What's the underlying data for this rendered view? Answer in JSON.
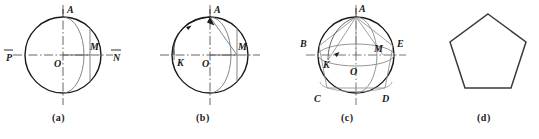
{
  "figure_set": {
    "description": "Four-panel geometric construction of a regular pentagon inscribed in a circle / sphere projection",
    "panels": [
      {
        "id": "a",
        "caption": "(a)",
        "caption_x": 56,
        "caption_y": 122,
        "labels": [
          {
            "name": "point-A",
            "text": "A",
            "x": 67,
            "y": 13,
            "overline": false
          },
          {
            "name": "point-P",
            "text": "P",
            "x": 9,
            "y": 61,
            "overline": true
          },
          {
            "name": "point-N",
            "text": "N",
            "x": 114,
            "y": 61,
            "overline": true
          },
          {
            "name": "point-O",
            "text": "O",
            "x": 57,
            "y": 67,
            "overline": false
          },
          {
            "name": "point-M",
            "text": "M",
            "x": 92,
            "y": 52,
            "overline": false
          }
        ]
      },
      {
        "id": "b",
        "caption": "(b)",
        "caption_x": 198,
        "caption_y": 122,
        "labels": [
          {
            "name": "point-A",
            "text": "A",
            "x": 213,
            "y": 13,
            "overline": false
          },
          {
            "name": "point-K",
            "text": "K",
            "x": 178,
            "y": 66,
            "overline": false
          },
          {
            "name": "point-O",
            "text": "O",
            "x": 203,
            "y": 67,
            "overline": false
          },
          {
            "name": "point-M",
            "text": "M",
            "x": 239,
            "y": 52,
            "overline": false
          }
        ]
      },
      {
        "id": "c",
        "caption": "(c)",
        "caption_x": 345,
        "caption_y": 122,
        "labels": [
          {
            "name": "point-A",
            "text": "A",
            "x": 357,
            "y": 12,
            "overline": false
          },
          {
            "name": "point-B",
            "text": "B",
            "x": 299,
            "y": 45,
            "overline": false
          },
          {
            "name": "point-E",
            "text": "E",
            "x": 393,
            "y": 45,
            "overline": false
          },
          {
            "name": "point-K",
            "text": "K",
            "x": 322,
            "y": 66,
            "overline": false
          },
          {
            "name": "point-O",
            "text": "O",
            "x": 350,
            "y": 73,
            "overline": false
          },
          {
            "name": "point-M",
            "text": "M",
            "x": 377,
            "y": 52,
            "overline": false
          },
          {
            "name": "point-C",
            "text": "C",
            "x": 313,
            "y": 101,
            "overline": false
          },
          {
            "name": "point-D",
            "text": "D",
            "x": 381,
            "y": 101,
            "overline": false
          }
        ]
      },
      {
        "id": "d",
        "caption": "(d)",
        "caption_x": 479,
        "caption_y": 122,
        "labels": []
      }
    ]
  },
  "style": {
    "stroke_dark": "#1a1a1a",
    "stroke_mid": "#555555",
    "stroke_light": "#888888",
    "background": "#ffffff"
  }
}
